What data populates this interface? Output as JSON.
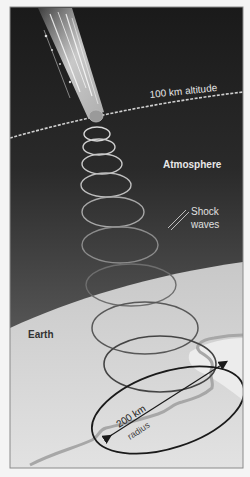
{
  "figure": {
    "labels": {
      "altitude": "100 km altitude",
      "atmosphere": "Atmosphere",
      "shock_line1": "Shock",
      "shock_line2": "waves",
      "earth": "Earth",
      "radius_value": "200 km",
      "radius_word": "radius"
    },
    "colors": {
      "space_top": "#1c1c1c",
      "space_bottom": "#6a6a6a",
      "earth_fill": "#d9d9d9",
      "altitude_line": "#cfcfcf",
      "river": "#a9a9a9",
      "frame": "#8a8a8a",
      "text_light": "#e8e8e8",
      "text_dark": "#333333"
    }
  }
}
